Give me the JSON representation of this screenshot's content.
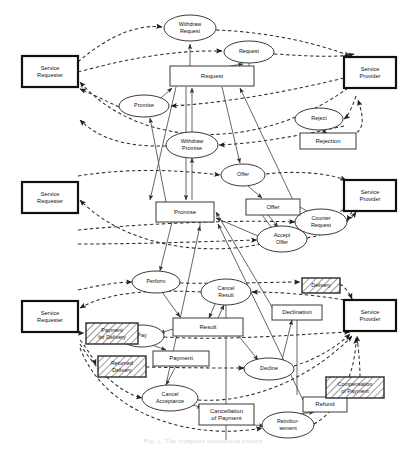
{
  "figure": {
    "caption": "Fig. 1. The complete transaction pattern",
    "background_color": "#ffffff",
    "line_color": "#3a3a3a",
    "actor_border_color": "#111111"
  },
  "legend": {
    "place_shape": "ellipse",
    "transition_shape": "rectangle",
    "actor_shape": "bold-rectangle",
    "hatched_shape": "hatched-rectangle",
    "solid_arc": "production/consumption arc",
    "dashed_arc": "communication arc"
  },
  "actors": [
    {
      "id": "req-top",
      "label_line1": "Service",
      "label_line2": "Requester",
      "x": 22,
      "y": 56,
      "w": 56,
      "h": 31
    },
    {
      "id": "prov-top",
      "label_line1": "Service",
      "label_line2": "Provider",
      "x": 344,
      "y": 57,
      "w": 52,
      "h": 31
    },
    {
      "id": "req-mid",
      "label_line1": "Service",
      "label_line2": "Requester",
      "x": 22,
      "y": 182,
      "w": 56,
      "h": 31
    },
    {
      "id": "prov-mid",
      "label_line1": "Service",
      "label_line2": "Provider",
      "x": 344,
      "y": 180,
      "w": 52,
      "h": 31
    },
    {
      "id": "req-bot",
      "label_line1": "Service",
      "label_line2": "Requester",
      "x": 22,
      "y": 301,
      "w": 56,
      "h": 31
    },
    {
      "id": "prov-bot",
      "label_line1": "Service",
      "label_line2": "Provider",
      "x": 344,
      "y": 300,
      "w": 52,
      "h": 31
    }
  ],
  "places": [
    {
      "id": "p-withdraw-request",
      "label_line1": "Withdraw",
      "label_line2": "Request",
      "cx": 190,
      "cy": 28,
      "rx": 26,
      "ry": 13
    },
    {
      "id": "p-request",
      "label_line1": "Request",
      "label_line2": "",
      "cx": 249,
      "cy": 52,
      "rx": 25,
      "ry": 11
    },
    {
      "id": "p-promise",
      "label_line1": "Promise",
      "label_line2": "",
      "cx": 144,
      "cy": 106,
      "rx": 25,
      "ry": 11
    },
    {
      "id": "p-reject",
      "label_line1": "Reject",
      "label_line2": "",
      "cx": 319,
      "cy": 119,
      "rx": 24,
      "ry": 11
    },
    {
      "id": "p-withdraw-promise",
      "label_line1": "Withdraw",
      "label_line2": "Promise",
      "cx": 192,
      "cy": 145,
      "rx": 26,
      "ry": 13
    },
    {
      "id": "p-offer",
      "label_line1": "Offer",
      "label_line2": "",
      "cx": 243,
      "cy": 175,
      "rx": 22,
      "ry": 11
    },
    {
      "id": "p-counter-request",
      "label_line1": "Counter",
      "label_line2": "Request",
      "cx": 321,
      "cy": 222,
      "rx": 26,
      "ry": 13
    },
    {
      "id": "p-accept-offer",
      "label_line1": "Accept",
      "label_line2": "Offer",
      "cx": 282,
      "cy": 239,
      "rx": 25,
      "ry": 13
    },
    {
      "id": "p-perform",
      "label_line1": "Perform",
      "label_line2": "",
      "cx": 156,
      "cy": 282,
      "rx": 24,
      "ry": 11
    },
    {
      "id": "p-cancel-result",
      "label_line1": "Cancel",
      "label_line2": "Result",
      "cx": 226,
      "cy": 292,
      "rx": 25,
      "ry": 13
    },
    {
      "id": "p-pay",
      "label_line1": "Pay",
      "label_line2": "",
      "cx": 142,
      "cy": 336,
      "rx": 22,
      "ry": 11
    },
    {
      "id": "p-decline",
      "label_line1": "Decline",
      "label_line2": "",
      "cx": 269,
      "cy": 369,
      "rx": 25,
      "ry": 11
    },
    {
      "id": "p-cancel-acceptance",
      "label_line1": "Cancel",
      "label_line2": "Acceptance",
      "cx": 170,
      "cy": 398,
      "rx": 28,
      "ry": 13
    },
    {
      "id": "p-reimbursement",
      "label_line1": "Reimbur-",
      "label_line2": "sement",
      "cx": 288,
      "cy": 425,
      "rx": 26,
      "ry": 13
    }
  ],
  "transitions": [
    {
      "id": "t-request",
      "label_line1": "Request",
      "label_line2": "",
      "x": 170,
      "y": 66,
      "w": 84,
      "h": 20
    },
    {
      "id": "t-rejection",
      "label_line1": "Rejection",
      "label_line2": "",
      "x": 300,
      "y": 133,
      "w": 56,
      "h": 16
    },
    {
      "id": "t-promise",
      "label_line1": "Promise",
      "label_line2": "",
      "x": 156,
      "y": 202,
      "w": 58,
      "h": 20
    },
    {
      "id": "t-offer",
      "label_line1": "Offer",
      "label_line2": "",
      "x": 246,
      "y": 199,
      "w": 54,
      "h": 16
    },
    {
      "id": "t-result",
      "label_line1": "Result",
      "label_line2": "",
      "x": 173,
      "y": 318,
      "w": 70,
      "h": 18
    },
    {
      "id": "t-declination",
      "label_line1": "Declination",
      "label_line2": "",
      "x": 272,
      "y": 305,
      "w": 50,
      "h": 15
    },
    {
      "id": "t-payment",
      "label_line1": "Payment",
      "label_line2": "",
      "x": 153,
      "y": 351,
      "w": 56,
      "h": 15
    },
    {
      "id": "t-cancellation",
      "label_line1": "Cancellation",
      "label_line2": "of Payment",
      "x": 199,
      "y": 404,
      "w": 55,
      "h": 21
    },
    {
      "id": "t-refund",
      "label_line1": "Refund",
      "label_line2": "",
      "x": 303,
      "y": 397,
      "w": 44,
      "h": 15
    }
  ],
  "hatched": [
    {
      "id": "h-payment-for-delivery",
      "label_line1": "Payment",
      "label_line2": "for Delivery",
      "x": 86,
      "y": 323,
      "w": 52,
      "h": 21
    },
    {
      "id": "h-returned-delivery",
      "label_line1": "Returned",
      "label_line2": "Delivery",
      "x": 98,
      "y": 356,
      "w": 48,
      "h": 21
    },
    {
      "id": "h-delivery",
      "label_line1": "Delivery",
      "label_line2": "",
      "x": 302,
      "y": 278,
      "w": 38,
      "h": 15
    },
    {
      "id": "h-compensation-of-payment",
      "label_line1": "Compensation",
      "label_line2": "of Payment",
      "x": 326,
      "y": 377,
      "w": 58,
      "h": 21
    }
  ]
}
